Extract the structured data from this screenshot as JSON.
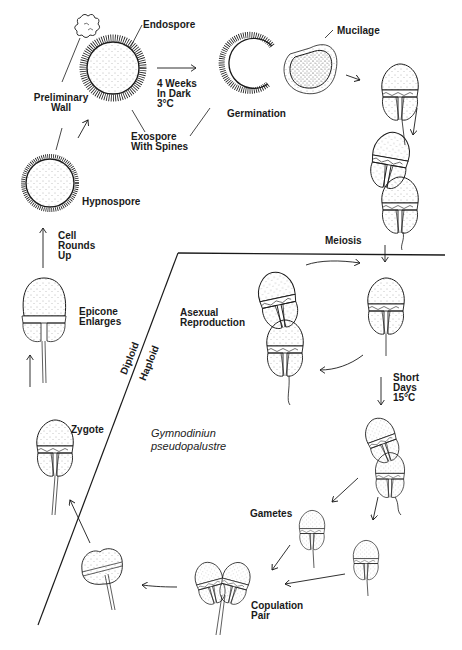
{
  "diagram": {
    "species": {
      "line1": "Gymnodiniun",
      "line2": "pseudopalustre"
    },
    "phase_labels": {
      "diploid": "Diploid",
      "haploid": "Haploid"
    },
    "labels": {
      "endospore": "Endospore",
      "preliminary_wall": "Preliminary\nWall",
      "conditions_dark": "4 Weeks\nIn Dark\n3°C",
      "exospore": "Exospore\nWith Spines",
      "germination": "Germination",
      "mucilage": "Mucilage",
      "hypnospore": "Hypnospore",
      "cell_rounds_up": "Cell\nRounds\nUp",
      "meiosis": "Meiosis",
      "epicone_enlarges": "Epicone\nEnlarges",
      "asexual_reproduction": "Asexual\nReproduction",
      "short_days": "Short\nDays\n15°C",
      "zygote": "Zygote",
      "gametes": "Gametes",
      "copulation_pair": "Copulation\nPair"
    },
    "colors": {
      "ink": "#1a1a1a",
      "background": "#ffffff",
      "stipple": "#555555"
    }
  }
}
